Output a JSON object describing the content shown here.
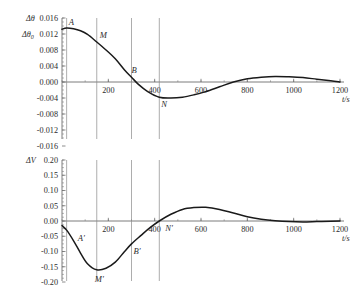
{
  "figure": {
    "panels": [
      "upper",
      "lower"
    ],
    "background_color": "#ffffff",
    "curve_color": "#1a1a1a",
    "axis_color": "#6e6e6e",
    "guide_color": "#8a8a8a"
  },
  "upper": {
    "y_axis_label": "Δθ",
    "y_axis_label2": "Δθ",
    "y_axis_label2_sub": "0",
    "x_axis_label": "t/s",
    "y_ticks": [
      "0.016",
      "0.012",
      "0.008",
      "0.004",
      "0.000",
      "-0.004",
      "-0.008",
      "-0.012",
      "-0.016"
    ],
    "x_ticks": [
      "200",
      "400",
      "600",
      "800",
      "1000",
      "1200"
    ],
    "points": [
      {
        "name": "A",
        "label": "A",
        "x": 20,
        "y": 0.0135
      },
      {
        "name": "M",
        "label": "M",
        "x": 150,
        "y": 0.01
      },
      {
        "name": "B",
        "label": "B",
        "x": 300,
        "y": 0.0012
      },
      {
        "name": "N",
        "label": "N",
        "x": 420,
        "y": -0.0038
      }
    ]
  },
  "lower": {
    "y_axis_label": "ΔV",
    "x_axis_label": "t/s",
    "y_ticks": [
      "0.20",
      "0.15",
      "0.10",
      "0.05",
      "0.00",
      "-0.05",
      "-0.10",
      "-0.15",
      "-0.20"
    ],
    "x_ticks": [
      "200",
      "400",
      "600",
      "800",
      "1000",
      "1200"
    ],
    "points": [
      {
        "name": "A-prime",
        "label": "A′",
        "x": 55,
        "y": -0.075
      },
      {
        "name": "M-prime",
        "label": "M′",
        "x": 150,
        "y": -0.16
      },
      {
        "name": "B-prime",
        "label": "B′",
        "x": 300,
        "y": -0.075
      },
      {
        "name": "N-prime",
        "label": "N′",
        "x": 420,
        "y": 0.0
      }
    ]
  },
  "chart_data": [
    {
      "type": "line",
      "panel": "upper",
      "title": "",
      "xlabel": "t/s",
      "ylabel": "Δθ",
      "xlim": [
        0,
        1200
      ],
      "ylim": [
        -0.016,
        0.016
      ],
      "grid": false,
      "legend": "none",
      "x_ticks": [
        0,
        200,
        400,
        600,
        800,
        1000,
        1200
      ],
      "y_ticks": [
        0.016,
        0.012,
        0.008,
        0.004,
        0.0,
        -0.004,
        -0.008,
        -0.012,
        -0.016
      ],
      "minor_tick_interval_x": 100,
      "minor_tick_interval_y": 0.001,
      "annotations": [
        {
          "text": "A",
          "x": 20,
          "y": 0.0135
        },
        {
          "text": "M",
          "x": 150,
          "y": 0.01
        },
        {
          "text": "B",
          "x": 300,
          "y": 0.0012
        },
        {
          "text": "N",
          "x": 420,
          "y": -0.0038
        }
      ],
      "vertical_guides": [
        20,
        150,
        300,
        420
      ],
      "x": [
        0,
        20,
        50,
        80,
        110,
        150,
        190,
        230,
        270,
        300,
        330,
        370,
        420,
        470,
        520,
        570,
        620,
        680,
        740,
        800,
        860,
        920,
        980,
        1040,
        1100,
        1160,
        1200
      ],
      "y": [
        0.0132,
        0.0135,
        0.0133,
        0.0128,
        0.0119,
        0.01,
        0.008,
        0.0058,
        0.003,
        0.0012,
        -0.0006,
        -0.0024,
        -0.0038,
        -0.004,
        -0.0038,
        -0.0032,
        -0.0024,
        -0.0012,
        0.0,
        0.0008,
        0.0012,
        0.0014,
        0.0013,
        0.0011,
        0.0007,
        0.0003,
        0.0
      ],
      "series": [
        {
          "name": "Δθ",
          "values": [
            0.0132,
            0.0135,
            0.0133,
            0.0128,
            0.0119,
            0.01,
            0.008,
            0.0058,
            0.003,
            0.0012,
            -0.0006,
            -0.0024,
            -0.0038,
            -0.004,
            -0.0038,
            -0.0032,
            -0.0024,
            -0.0012,
            0.0,
            0.0008,
            0.0012,
            0.0014,
            0.0013,
            0.0011,
            0.0007,
            0.0003,
            0.0
          ]
        }
      ]
    },
    {
      "type": "line",
      "panel": "lower",
      "title": "",
      "xlabel": "t/s",
      "ylabel": "ΔV",
      "xlim": [
        0,
        1200
      ],
      "ylim": [
        -0.2,
        0.2
      ],
      "grid": false,
      "legend": "none",
      "x_ticks": [
        0,
        200,
        400,
        600,
        800,
        1000,
        1200
      ],
      "y_ticks": [
        0.2,
        0.15,
        0.1,
        0.05,
        0.0,
        -0.05,
        -0.1,
        -0.15,
        -0.2
      ],
      "minor_tick_interval_x": 100,
      "minor_tick_interval_y": 0.0125,
      "annotations": [
        {
          "text": "A′",
          "x": 55,
          "y": -0.075
        },
        {
          "text": "M′",
          "x": 150,
          "y": -0.16
        },
        {
          "text": "B′",
          "x": 300,
          "y": -0.075
        },
        {
          "text": "N′",
          "x": 420,
          "y": 0.0
        }
      ],
      "vertical_guides": [
        20,
        150,
        300,
        420
      ],
      "x": [
        0,
        20,
        50,
        80,
        110,
        150,
        190,
        230,
        270,
        300,
        340,
        380,
        420,
        470,
        520,
        570,
        620,
        680,
        740,
        800,
        860,
        920,
        980,
        1040,
        1100,
        1160,
        1200
      ],
      "y": [
        -0.015,
        -0.03,
        -0.065,
        -0.105,
        -0.14,
        -0.16,
        -0.155,
        -0.135,
        -0.1,
        -0.075,
        -0.048,
        -0.022,
        0.0,
        0.022,
        0.038,
        0.044,
        0.045,
        0.038,
        0.026,
        0.014,
        0.006,
        0.001,
        -0.002,
        -0.003,
        -0.002,
        -0.001,
        0.0
      ],
      "series": [
        {
          "name": "ΔV",
          "values": [
            -0.015,
            -0.03,
            -0.065,
            -0.105,
            -0.14,
            -0.16,
            -0.155,
            -0.135,
            -0.1,
            -0.075,
            -0.048,
            -0.022,
            0.0,
            0.022,
            0.038,
            0.044,
            0.045,
            0.038,
            0.026,
            0.014,
            0.006,
            0.001,
            -0.002,
            -0.003,
            -0.002,
            -0.001,
            0.0
          ]
        }
      ]
    }
  ]
}
